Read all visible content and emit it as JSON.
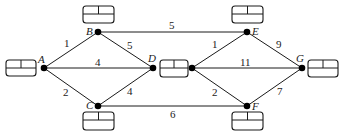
{
  "diagram": {
    "type": "weighted-network",
    "nodes": [
      {
        "id": "A",
        "label": "A",
        "x": 44,
        "y": 68
      },
      {
        "id": "B",
        "label": "B",
        "x": 98,
        "y": 32
      },
      {
        "id": "C",
        "label": "C",
        "x": 98,
        "y": 106
      },
      {
        "id": "D",
        "label": "D",
        "x": 153,
        "y": 68
      },
      {
        "id": "D2",
        "label": "",
        "x": 192,
        "y": 68
      },
      {
        "id": "E",
        "label": "E",
        "x": 247,
        "y": 32
      },
      {
        "id": "F",
        "label": "F",
        "x": 247,
        "y": 106
      },
      {
        "id": "G",
        "label": "G",
        "x": 302,
        "y": 68
      }
    ],
    "edges": [
      {
        "from": "A",
        "to": "B",
        "weight": "1"
      },
      {
        "from": "A",
        "to": "D",
        "weight": "4"
      },
      {
        "from": "A",
        "to": "C",
        "weight": "2"
      },
      {
        "from": "B",
        "to": "D",
        "weight": "5"
      },
      {
        "from": "B",
        "to": "E",
        "weight": "5"
      },
      {
        "from": "C",
        "to": "D",
        "weight": "4"
      },
      {
        "from": "C",
        "to": "F",
        "weight": "6"
      },
      {
        "from": "D",
        "to": "E",
        "weight": "1"
      },
      {
        "from": "D",
        "to": "G",
        "weight": "11"
      },
      {
        "from": "D",
        "to": "F",
        "weight": "2"
      },
      {
        "from": "E",
        "to": "G",
        "weight": "9"
      },
      {
        "from": "F",
        "to": "G",
        "weight": "7"
      }
    ],
    "boxes": [
      {
        "node": "A",
        "x": 6,
        "y": 60,
        "w": 30,
        "h": 16
      },
      {
        "node": "B",
        "x": 83,
        "y": 6,
        "w": 31,
        "h": 17
      },
      {
        "node": "C",
        "x": 83,
        "y": 112,
        "w": 31,
        "h": 18
      },
      {
        "node": "D",
        "x": 160,
        "y": 60,
        "w": 28,
        "h": 17
      },
      {
        "node": "E",
        "x": 232,
        "y": 6,
        "w": 31,
        "h": 17
      },
      {
        "node": "F",
        "x": 232,
        "y": 112,
        "w": 31,
        "h": 18
      },
      {
        "node": "G",
        "x": 308,
        "y": 60,
        "w": 30,
        "h": 17
      }
    ]
  }
}
